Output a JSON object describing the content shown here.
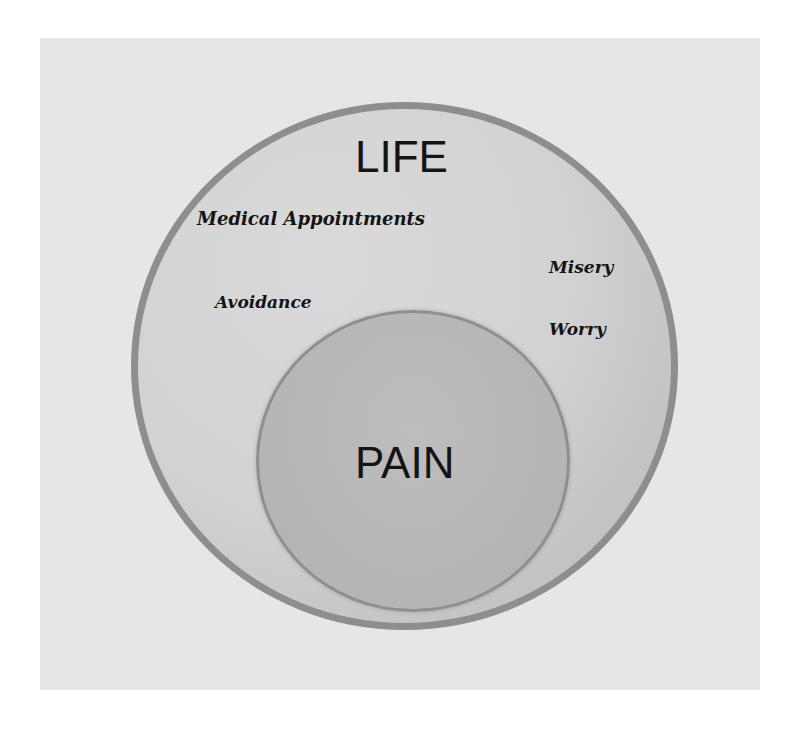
{
  "diagram": {
    "type": "nested-circles",
    "outer_circle": {
      "label": "LIFE",
      "fill": "#d4d4d4",
      "border": "#8e8e8e"
    },
    "inner_circle": {
      "label": "PAIN",
      "fill": "#b8b8b8",
      "border": "#8f8f8f"
    },
    "outer_items": [
      {
        "label": "Medical Appointments"
      },
      {
        "label": "Misery"
      },
      {
        "label": "Avoidance"
      },
      {
        "label": "Worry"
      }
    ],
    "background": "#e6e6e6"
  }
}
